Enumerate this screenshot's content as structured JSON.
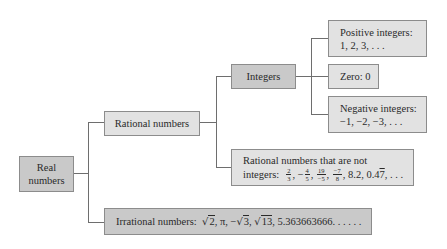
{
  "diagram": {
    "type": "tree",
    "root": {
      "label_line1": "Real",
      "label_line2": "numbers"
    },
    "rational": {
      "label": "Rational numbers"
    },
    "integers": {
      "label": "Integers"
    },
    "positive": {
      "label": "Positive integers:",
      "examples": "1, 2, 3, . . ."
    },
    "zero": {
      "label": "Zero: 0"
    },
    "negative": {
      "label": "Negative integers:",
      "examples": "−1, −2, −3, . . ."
    },
    "non_integer_rational": {
      "label": "Rational numbers that are not",
      "label2": "integers:",
      "fractions": [
        {
          "sign": "",
          "num": "2",
          "den": "3"
        },
        {
          "sign": "−",
          "num": "4",
          "den": "5"
        },
        {
          "sign": "",
          "num": "19",
          "den": "−5"
        },
        {
          "sign": "",
          "num": "−7",
          "den": "8"
        }
      ],
      "decimal1": "8.2",
      "decimal2_prefix": "0.4",
      "decimal2_repeat": "7",
      "ellipsis": ". . ."
    },
    "irrational": {
      "label": "Irrational numbers:",
      "items": [
        "2",
        "π",
        "3",
        "13"
      ],
      "decimal": "5.363663666. . . . . ."
    },
    "colors": {
      "dark_box": "#c9c9c9",
      "light_box": "#e2e2e2",
      "border": "#8c8c8c",
      "connector": "#6e6e6e"
    }
  }
}
